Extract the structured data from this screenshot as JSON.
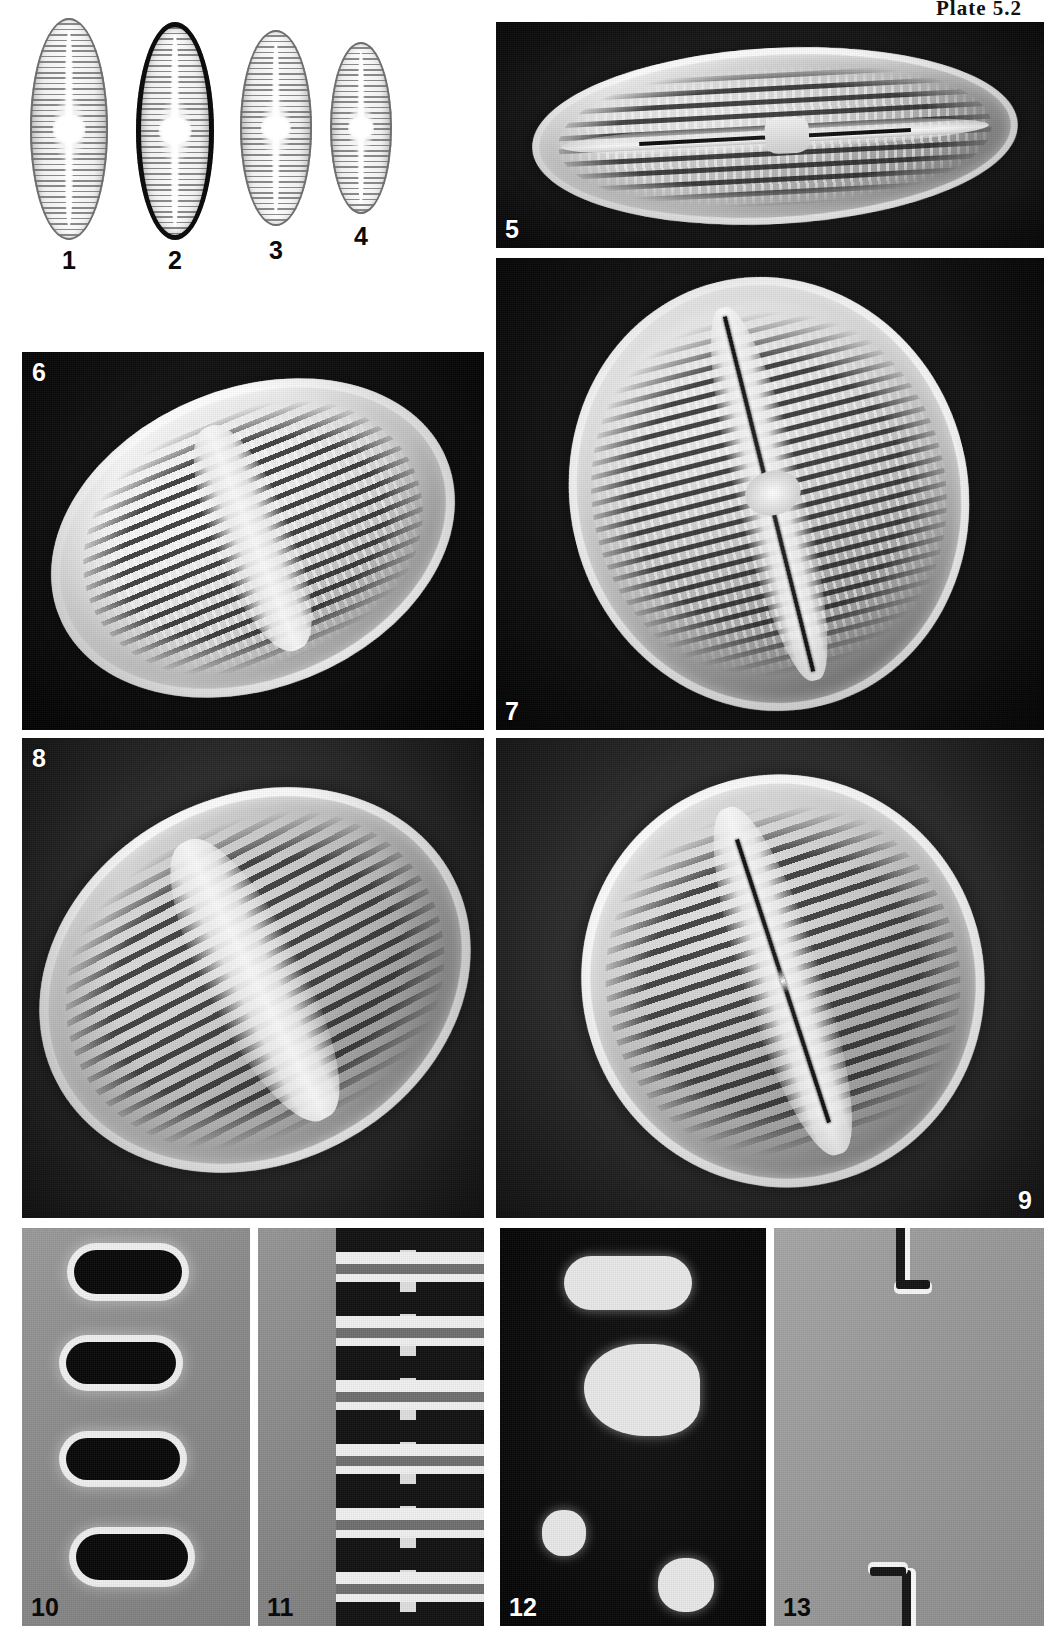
{
  "plate": {
    "header_label": "Plate 5.2",
    "description": "Taxonomic micrograph plate: light-microscope valve views (1-4), scanning electron micrographs (5-9) and structural details (10-13) of a naviculoid diatom",
    "background_color": "#ffffff"
  },
  "lm_figures": [
    {
      "number": "1",
      "caption": "1",
      "style": "thin-outline"
    },
    {
      "number": "2",
      "caption": "2",
      "style": "thick-dark-outline"
    },
    {
      "number": "3",
      "caption": "3",
      "style": "thin-outline"
    },
    {
      "number": "4",
      "caption": "4",
      "style": "thin-outline-small"
    }
  ],
  "sem_panels": [
    {
      "number": "5",
      "label": "5",
      "label_position": "bottom-left",
      "label_color": "#ffffff",
      "background": "#121212",
      "view": "external-valve-oblique"
    },
    {
      "number": "6",
      "label": "6",
      "label_position": "top-left",
      "label_color": "#ffffff",
      "background": "#0c0c0c",
      "view": "internal-valve"
    },
    {
      "number": "7",
      "label": "7",
      "label_position": "bottom-left",
      "label_color": "#ffffff",
      "background": "#101010",
      "view": "internal-valve-areolae"
    },
    {
      "number": "8",
      "label": "8",
      "label_position": "top-left",
      "label_color": "#ffffff",
      "background": "#2b2b2b",
      "view": "external-valve"
    },
    {
      "number": "9",
      "label": "9",
      "label_position": "bottom-right",
      "label_color": "#ffffff",
      "background": "#2e2e2e",
      "view": "external-valve-raphe"
    }
  ],
  "detail_panels": [
    {
      "number": "10",
      "label": "10",
      "label_color": "#111111",
      "background": "#8d8d8d",
      "view": "areolae-detail-light"
    },
    {
      "number": "11",
      "label": "11",
      "label_color": "#111111",
      "background": "#8a8a8a",
      "view": "striae-detail-light"
    },
    {
      "number": "12",
      "label": "12",
      "label_color": "#ffffff",
      "background": "#070707",
      "view": "areolae-detail-dark"
    },
    {
      "number": "13",
      "label": "13",
      "label_color": "#151515",
      "background": "#9a9a9a",
      "view": "raphe-ending-detail"
    }
  ],
  "colors": {
    "page_background": "#ffffff",
    "sem_dark": "#121212",
    "sem_mid": "#2e2e2e",
    "detail_gray": "#8d8d8d",
    "label_light": "#ffffff",
    "label_dark": "#111111"
  }
}
